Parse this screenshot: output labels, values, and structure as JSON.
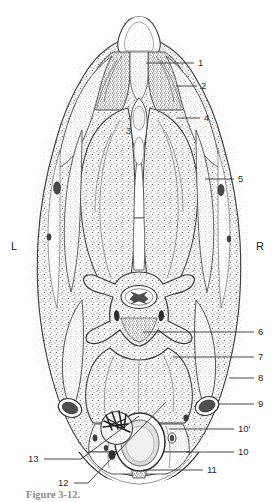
{
  "figure": {
    "background_color": "#ffffff",
    "ink_color": "#333333",
    "side_markers": [
      {
        "id": "left-marker",
        "text": "L",
        "x": 11,
        "y": 241
      },
      {
        "id": "right-marker",
        "text": "R",
        "x": 256,
        "y": 241
      }
    ],
    "center_labels": [
      {
        "id": "label-3",
        "text": "3",
        "x": 126,
        "y": 127
      }
    ],
    "labels": [
      {
        "id": "label-1",
        "text": "1",
        "x": 198,
        "y": 58,
        "line": [
          146,
          63,
          194,
          63
        ]
      },
      {
        "id": "label-2",
        "text": "2",
        "x": 201,
        "y": 81,
        "line": [
          176,
          86,
          197,
          86
        ]
      },
      {
        "id": "label-4",
        "text": "4",
        "x": 204,
        "y": 113,
        "line": [
          177,
          118,
          200,
          118
        ]
      },
      {
        "id": "label-5",
        "text": "5",
        "x": 238,
        "y": 174,
        "line": [
          205,
          179,
          234,
          179
        ]
      },
      {
        "id": "label-6",
        "text": "6",
        "x": 258,
        "y": 327,
        "line": [
          143,
          332,
          254,
          332
        ]
      },
      {
        "id": "label-7",
        "text": "7",
        "x": 258,
        "y": 352,
        "line": [
          173,
          357,
          254,
          357
        ]
      },
      {
        "id": "label-8",
        "text": "8",
        "x": 258,
        "y": 373,
        "line": [
          229,
          378,
          254,
          378
        ]
      },
      {
        "id": "label-9",
        "text": "9",
        "x": 258,
        "y": 399,
        "line": [
          219,
          404,
          254,
          404
        ]
      },
      {
        "id": "label-10-prime",
        "text": "10'",
        "x": 238,
        "y": 424,
        "line": [
          169,
          429,
          234,
          429
        ]
      },
      {
        "id": "label-10",
        "text": "10",
        "x": 238,
        "y": 447,
        "line": [
          186,
          452,
          234,
          452
        ]
      },
      {
        "id": "label-11",
        "text": "11",
        "x": 207,
        "y": 465,
        "line": [
          143,
          470,
          203,
          470
        ]
      },
      {
        "id": "label-12",
        "text": "12",
        "x": 58,
        "y": 478,
        "line": [
          74,
          483,
          88,
          483
        ]
      },
      {
        "id": "label-13",
        "text": "13",
        "x": 28,
        "y": 454,
        "line": [
          44,
          459,
          81,
          459
        ]
      }
    ],
    "label_leaders_diagonal": [
      {
        "id": "leader-12-diagonal",
        "points": "88,483 183,399"
      },
      {
        "id": "leader-13-diagonal",
        "points": "81,459 115,436"
      }
    ],
    "caption": {
      "prefix": "Figure",
      "number": "3-12.",
      "text": "Figure 3-12."
    }
  }
}
